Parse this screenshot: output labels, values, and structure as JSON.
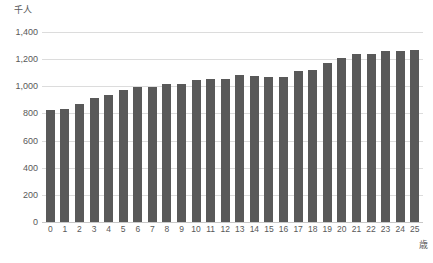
{
  "chart_data": {
    "type": "bar",
    "title": "",
    "subtitle": "",
    "xlabel": "歳",
    "ylabel": "千人",
    "ylim": [
      0,
      1400
    ],
    "ytick_step": 200,
    "grid": true,
    "legend": "none",
    "bar_color": "#595959",
    "grid_color": "#dcdcdc",
    "categories": [
      "0",
      "1",
      "2",
      "3",
      "4",
      "5",
      "6",
      "7",
      "8",
      "9",
      "10",
      "11",
      "12",
      "13",
      "14",
      "15",
      "16",
      "17",
      "18",
      "19",
      "20",
      "21",
      "22",
      "23",
      "24",
      "25"
    ],
    "values": [
      828,
      833,
      868,
      912,
      933,
      972,
      996,
      993,
      1016,
      1020,
      1045,
      1053,
      1057,
      1080,
      1074,
      1066,
      1065,
      1110,
      1120,
      1170,
      1211,
      1235,
      1236,
      1262,
      1263,
      1265
    ],
    "ytick_labels": [
      "1,400",
      "1,200",
      "1,000",
      "800",
      "600",
      "400",
      "200",
      "0"
    ],
    "ytick_values": [
      1400,
      1200,
      1000,
      800,
      600,
      400,
      200,
      0
    ]
  }
}
